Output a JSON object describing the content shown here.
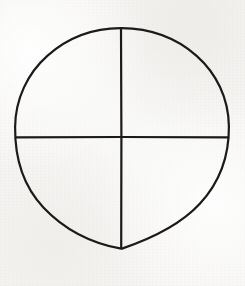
{
  "figure": {
    "name": "quartered-circle",
    "alt_names": [
      "sun cross",
      "crosshair",
      "wheel cross",
      "quartered circle"
    ],
    "canvas": {
      "width": 245,
      "height": 286
    },
    "colors": {
      "background": "#f6f5f3",
      "ink": "#1c1a19",
      "page": "#ffffff"
    },
    "stroke": {
      "circle_width": 2.2,
      "diameter_width": 2.2
    },
    "circle": {
      "center_x": 122,
      "center_y": 138,
      "radius_x": 107,
      "radius_y": 110,
      "left_x": 15,
      "right_x": 229,
      "top_y": 28,
      "bottom_y": 248
    },
    "vertical_diameter": {
      "x": 121,
      "y_start": 28,
      "y_end": 249
    },
    "horizontal_diameter": {
      "y": 137,
      "x_start": 15,
      "x_end": 229
    },
    "quadrants": [
      {
        "id": "upper-left",
        "label": ""
      },
      {
        "id": "upper-right",
        "label": ""
      },
      {
        "id": "lower-left",
        "label": ""
      },
      {
        "id": "lower-right",
        "label": ""
      }
    ]
  }
}
